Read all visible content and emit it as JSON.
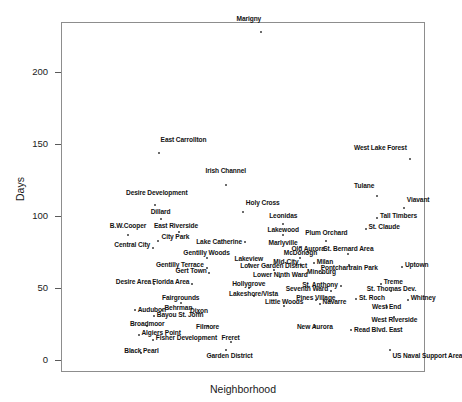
{
  "chart_data": {
    "type": "scatter",
    "title": "",
    "xlabel": "Neighborhood",
    "ylabel": "Days",
    "ylim": [
      -8,
      235
    ],
    "yticks": [
      0,
      50,
      100,
      150,
      200
    ],
    "ytick_labels": [
      "0",
      "50",
      "100",
      "150",
      "200"
    ],
    "xticks": [],
    "grid": false,
    "legend": null,
    "points": [
      {
        "label": "Marigny",
        "x": 209,
        "y": 228,
        "lx": 209,
        "ly": 236,
        "align": "right"
      },
      {
        "label": "West Lake Forest",
        "x": 364,
        "y": 140,
        "lx": 361,
        "ly": 146,
        "align": "right"
      },
      {
        "label": "East Carrollton",
        "x": 102,
        "y": 144,
        "lx": 104,
        "ly": 152,
        "align": "left"
      },
      {
        "label": "Irish Channel",
        "x": 172,
        "y": 122,
        "lx": 172,
        "ly": 130,
        "align": "center"
      },
      {
        "label": "Tulane",
        "x": 330,
        "y": 114,
        "lx": 327,
        "ly": 120,
        "align": "right"
      },
      {
        "label": "Viavant",
        "x": 358,
        "y": 106,
        "lx": 361,
        "ly": 110,
        "align": "left"
      },
      {
        "label": "Desire Development",
        "x": 98,
        "y": 108,
        "lx": 100,
        "ly": 115,
        "align": "center"
      },
      {
        "label": "Holy Cross",
        "x": 190,
        "y": 103,
        "lx": 193,
        "ly": 108,
        "align": "left"
      },
      {
        "label": "Tall Timbers",
        "x": 330,
        "y": 99,
        "lx": 333,
        "ly": 99,
        "align": "left"
      },
      {
        "label": "Dillard",
        "x": 104,
        "y": 98,
        "lx": 104,
        "ly": 102,
        "align": "center"
      },
      {
        "label": "Leonidas",
        "x": 232,
        "y": 95,
        "lx": 232,
        "ly": 99,
        "align": "center"
      },
      {
        "label": "St. Claude",
        "x": 318,
        "y": 91,
        "lx": 321,
        "ly": 91,
        "align": "left"
      },
      {
        "label": "B.W.Cooper",
        "x": 70,
        "y": 87,
        "lx": 70,
        "ly": 92,
        "align": "center"
      },
      {
        "label": "East Riverside",
        "x": 123,
        "y": 89,
        "lx": 120,
        "ly": 92,
        "align": "center"
      },
      {
        "label": "Lakewood",
        "x": 232,
        "y": 87,
        "lx": 232,
        "ly": 89,
        "align": "center"
      },
      {
        "label": "Plum Orchard",
        "x": 277,
        "y": 83,
        "lx": 277,
        "ly": 87,
        "align": "center"
      },
      {
        "label": "City Park",
        "x": 101,
        "y": 83,
        "lx": 105,
        "ly": 84,
        "align": "left"
      },
      {
        "label": "Lake Catherine",
        "x": 192,
        "y": 82,
        "lx": 189,
        "ly": 81,
        "align": "right"
      },
      {
        "label": "Marlyville",
        "x": 250,
        "y": 79,
        "lx": 247,
        "ly": 80,
        "align": "right"
      },
      {
        "label": "Central City",
        "x": 96,
        "y": 78,
        "lx": 93,
        "ly": 79,
        "align": "right"
      },
      {
        "label": "Old Aurora",
        "x": 258,
        "y": 75,
        "lx": 258,
        "ly": 76,
        "align": "center"
      },
      {
        "label": "St. Bernard Area",
        "x": 300,
        "y": 74,
        "lx": 300,
        "ly": 76,
        "align": "center"
      },
      {
        "label": "Gentilly Woods",
        "x": 152,
        "y": 71,
        "lx": 152,
        "ly": 73,
        "align": "center"
      },
      {
        "label": "McDonogh",
        "x": 250,
        "y": 71,
        "lx": 250,
        "ly": 73,
        "align": "center"
      },
      {
        "label": "Lakeview",
        "x": 196,
        "y": 67,
        "lx": 196,
        "ly": 69,
        "align": "center"
      },
      {
        "label": "Mid-City",
        "x": 251,
        "y": 66,
        "lx": 248,
        "ly": 67,
        "align": "right"
      },
      {
        "label": "Milan",
        "x": 264,
        "y": 68,
        "lx": 267,
        "ly": 67,
        "align": "left"
      },
      {
        "label": "Uptown",
        "x": 356,
        "y": 65,
        "lx": 359,
        "ly": 65,
        "align": "left"
      },
      {
        "label": "Gentilly Terrace",
        "x": 152,
        "y": 64,
        "lx": 149,
        "ly": 65,
        "align": "right"
      },
      {
        "label": "Lower Garden District",
        "x": 222,
        "y": 63,
        "lx": 222,
        "ly": 64,
        "align": "center"
      },
      {
        "label": "Pontchartrain Park",
        "x": 301,
        "y": 66,
        "lx": 301,
        "ly": 63,
        "align": "center"
      },
      {
        "label": "Gert Town",
        "x": 155,
        "y": 61,
        "lx": 152,
        "ly": 61,
        "align": "right"
      },
      {
        "label": "Mineburg",
        "x": 272,
        "y": 61,
        "lx": 272,
        "ly": 60,
        "align": "center"
      },
      {
        "label": "Lower Ninth Ward",
        "x": 229,
        "y": 58,
        "lx": 229,
        "ly": 58,
        "align": "center"
      },
      {
        "label": "Desire Area",
        "x": 97,
        "y": 53,
        "lx": 94,
        "ly": 53,
        "align": "right"
      },
      {
        "label": "Florida Area",
        "x": 137,
        "y": 53,
        "lx": 134,
        "ly": 53,
        "align": "right"
      },
      {
        "label": "Hollygrove",
        "x": 196,
        "y": 50,
        "lx": 196,
        "ly": 52,
        "align": "center"
      },
      {
        "label": "St. Anthony",
        "x": 292,
        "y": 52,
        "lx": 289,
        "ly": 51,
        "align": "right"
      },
      {
        "label": "Treme",
        "x": 334,
        "y": 53,
        "lx": 337,
        "ly": 53,
        "align": "left"
      },
      {
        "label": "Seventh Ward",
        "x": 282,
        "y": 48,
        "lx": 279,
        "ly": 48,
        "align": "right"
      },
      {
        "label": "St. Thomas Dev.",
        "x": 345,
        "y": 48,
        "lx": 345,
        "ly": 48,
        "align": "center"
      },
      {
        "label": "Lakeshore/Vista",
        "x": 201,
        "y": 45,
        "lx": 201,
        "ly": 45,
        "align": "center"
      },
      {
        "label": "Fairgrounds",
        "x": 125,
        "y": 40,
        "lx": 125,
        "ly": 42,
        "align": "center"
      },
      {
        "label": "Pines Village",
        "x": 266,
        "y": 42,
        "lx": 266,
        "ly": 42,
        "align": "center"
      },
      {
        "label": "St. Roch",
        "x": 308,
        "y": 43,
        "lx": 311,
        "ly": 42,
        "align": "left"
      },
      {
        "label": "Whitney",
        "x": 362,
        "y": 42,
        "lx": 365,
        "ly": 42,
        "align": "left"
      },
      {
        "label": "Little Woods",
        "x": 233,
        "y": 38,
        "lx": 233,
        "ly": 39,
        "align": "center"
      },
      {
        "label": "Navarre",
        "x": 270,
        "y": 39,
        "lx": 273,
        "ly": 39,
        "align": "left"
      },
      {
        "label": "West End",
        "x": 340,
        "y": 37,
        "lx": 340,
        "ly": 36,
        "align": "center"
      },
      {
        "label": "Audubon",
        "x": 77,
        "y": 35,
        "lx": 80,
        "ly": 34,
        "align": "left"
      },
      {
        "label": "Behrman",
        "x": 105,
        "y": 35,
        "lx": 108,
        "ly": 35,
        "align": "left"
      },
      {
        "label": "Dixon",
        "x": 144,
        "y": 33,
        "lx": 144,
        "ly": 33,
        "align": "center"
      },
      {
        "label": "Bayou St. John",
        "x": 97,
        "y": 31,
        "lx": 100,
        "ly": 30,
        "align": "left"
      },
      {
        "label": "West Riverside",
        "x": 348,
        "y": 30,
        "lx": 348,
        "ly": 27,
        "align": "center"
      },
      {
        "label": "Broadmoor",
        "x": 90,
        "y": 24,
        "lx": 90,
        "ly": 24,
        "align": "center"
      },
      {
        "label": "Filmore",
        "x": 153,
        "y": 24,
        "lx": 153,
        "ly": 22,
        "align": "center"
      },
      {
        "label": "New Aurora",
        "x": 265,
        "y": 24,
        "lx": 265,
        "ly": 22,
        "align": "center"
      },
      {
        "label": "Read Blvd. East",
        "x": 303,
        "y": 21,
        "lx": 306,
        "ly": 20,
        "align": "left"
      },
      {
        "label": "Algiers Point",
        "x": 81,
        "y": 18,
        "lx": 84,
        "ly": 18,
        "align": "left"
      },
      {
        "label": "Fisher Development",
        "x": 96,
        "y": 14,
        "lx": 99,
        "ly": 14,
        "align": "left"
      },
      {
        "label": "Freret",
        "x": 177,
        "y": 13,
        "lx": 177,
        "ly": 14,
        "align": "center"
      },
      {
        "label": "Black Pearl",
        "x": 84,
        "y": 5,
        "lx": 84,
        "ly": 5,
        "align": "center"
      },
      {
        "label": "Garden District",
        "x": 172,
        "y": 7,
        "lx": 176,
        "ly": 2,
        "align": "center"
      },
      {
        "label": "US Naval Support Area",
        "x": 343,
        "y": 7,
        "lx": 346,
        "ly": 2,
        "align": "left"
      }
    ]
  }
}
